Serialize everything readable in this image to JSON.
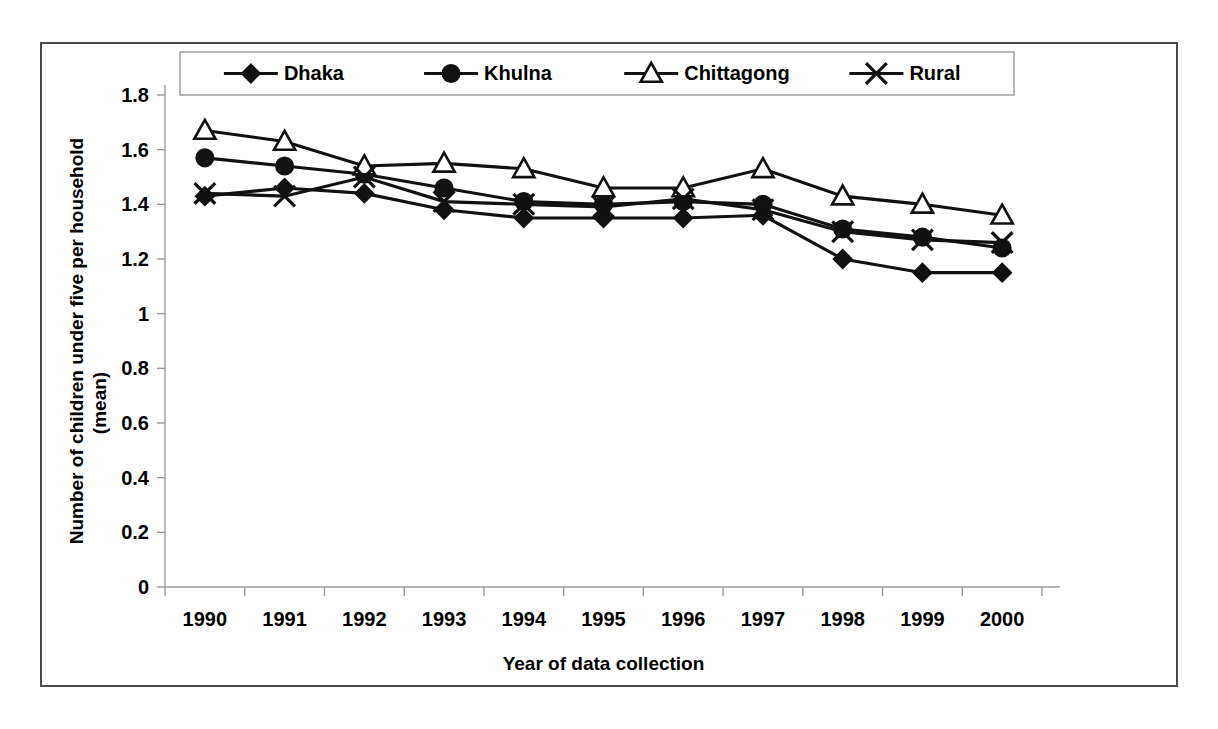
{
  "chart_data": {
    "type": "line",
    "title": "",
    "xlabel": "Year of data collection",
    "ylabel": "Number of children under five per household (mean)",
    "ylabel_line1": "Number of children under five per household",
    "ylabel_line2": "(mean)",
    "categories": [
      "1990",
      "1991",
      "1992",
      "1993",
      "1994",
      "1995",
      "1996",
      "1997",
      "1998",
      "1999",
      "2000"
    ],
    "x": [
      1990,
      1991,
      1992,
      1993,
      1994,
      1995,
      1996,
      1997,
      1998,
      1999,
      2000
    ],
    "ylim": [
      0,
      1.8
    ],
    "xlim_categories": 11,
    "y_ticks": [
      "0",
      "0.2",
      "0.4",
      "0.6",
      "0.8",
      "1",
      "1.2",
      "1.4",
      "1.6",
      "1.8"
    ],
    "y_tick_values": [
      0,
      0.2,
      0.4,
      0.6,
      0.8,
      1.0,
      1.2,
      1.4,
      1.6,
      1.8
    ],
    "grid": false,
    "legend_position": "top-inside",
    "series": [
      {
        "name": "Dhaka",
        "marker": "diamond",
        "values": [
          1.43,
          1.46,
          1.44,
          1.38,
          1.35,
          1.35,
          1.35,
          1.36,
          1.2,
          1.15,
          1.15
        ]
      },
      {
        "name": "Khulna",
        "marker": "circle",
        "values": [
          1.57,
          1.54,
          1.51,
          1.46,
          1.41,
          1.4,
          1.41,
          1.4,
          1.31,
          1.28,
          1.24
        ]
      },
      {
        "name": "Chittagong",
        "marker": "triangle",
        "values": [
          1.67,
          1.63,
          1.54,
          1.55,
          1.53,
          1.46,
          1.46,
          1.53,
          1.43,
          1.4,
          1.36
        ]
      },
      {
        "name": "Rural",
        "marker": "cross",
        "values": [
          1.44,
          1.43,
          1.5,
          1.41,
          1.4,
          1.39,
          1.42,
          1.38,
          1.3,
          1.27,
          1.26
        ]
      }
    ]
  },
  "legend": {
    "items": [
      {
        "label": "Dhaka",
        "marker": "diamond"
      },
      {
        "label": "Khulna",
        "marker": "circle"
      },
      {
        "label": "Chittagong",
        "marker": "triangle"
      },
      {
        "label": "Rural",
        "marker": "cross"
      }
    ]
  },
  "colors": {
    "series": "#111111",
    "axis": "#9a9a9a",
    "frame": "#4a4a4a",
    "background": "#ffffff"
  }
}
